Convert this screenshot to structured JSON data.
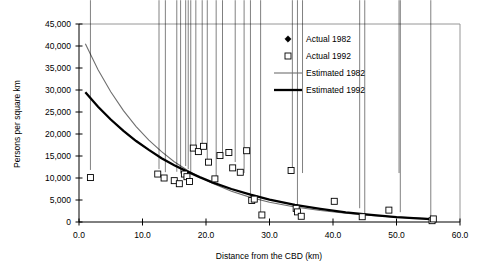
{
  "chart_data": {
    "type": "scatter",
    "title": "",
    "xlabel": "Distance from the CBD (km)",
    "ylabel": "Persons per square km",
    "xlim": [
      0.0,
      60.0
    ],
    "ylim": [
      0,
      45000
    ],
    "xticks": [
      "0.0",
      "10.0",
      "20.0",
      "30.0",
      "40.0",
      "50.0",
      "60.0"
    ],
    "xtick_values": [
      0,
      10,
      20,
      30,
      40,
      50,
      60
    ],
    "yticks": [
      "0",
      "5,000",
      "10,000",
      "15,000",
      "20,000",
      "25,000",
      "30,000",
      "35,000",
      "40,000",
      "45,000"
    ],
    "ytick_values": [
      0,
      5000,
      10000,
      15000,
      20000,
      25000,
      30000,
      35000,
      40000,
      45000
    ],
    "grid": false,
    "legend_position": "top-right",
    "legend": [
      {
        "label": "Actual 1982",
        "marker": "filled-diamond",
        "color": "#000000"
      },
      {
        "label": "Actual 1992",
        "marker": "open-square",
        "color": "#000000"
      },
      {
        "label": "Estimated 1982",
        "marker": "thin-line",
        "color": "#6f6f6f"
      },
      {
        "label": "Estimated 1992",
        "marker": "thick-line",
        "color": "#000000"
      }
    ],
    "series": [
      {
        "name": "Actual 1982",
        "type": "scatter",
        "marker": "filled-diamond",
        "points": [
          [
            1.8,
            11100
          ],
          [
            12.6,
            11300
          ],
          [
            13.6,
            10600
          ],
          [
            15.4,
            10700
          ],
          [
            16.0,
            10300
          ],
          [
            16.8,
            12000
          ],
          [
            17.2,
            11300
          ],
          [
            17.6,
            10200
          ],
          [
            18.4,
            15900
          ],
          [
            19.4,
            16500
          ],
          [
            20.2,
            12600
          ],
          [
            21.6,
            9000
          ],
          [
            22.6,
            14200
          ],
          [
            24.6,
            12900
          ],
          [
            26.0,
            10400
          ],
          [
            27.0,
            4200
          ],
          [
            28.6,
            1200
          ],
          [
            33.6,
            10500
          ],
          [
            34.4,
            2100
          ],
          [
            35.2,
            10400
          ],
          [
            44.2,
            2400
          ],
          [
            45.0,
            700
          ],
          [
            50.4,
            10400
          ],
          [
            50.6,
            1500
          ],
          [
            55.4,
            500
          ]
        ]
      },
      {
        "name": "Actual 1992",
        "type": "scatter",
        "marker": "open-square",
        "points": [
          [
            1.8,
            10100
          ],
          [
            12.4,
            10900
          ],
          [
            13.4,
            10000
          ],
          [
            15.0,
            9400
          ],
          [
            15.8,
            8700
          ],
          [
            16.6,
            10900
          ],
          [
            17.0,
            10300
          ],
          [
            17.4,
            9200
          ],
          [
            18.0,
            16800
          ],
          [
            18.8,
            16000
          ],
          [
            19.6,
            17200
          ],
          [
            20.4,
            13600
          ],
          [
            21.4,
            9800
          ],
          [
            22.2,
            15100
          ],
          [
            23.6,
            15800
          ],
          [
            24.2,
            12300
          ],
          [
            25.4,
            11300
          ],
          [
            26.4,
            16200
          ],
          [
            27.2,
            4900
          ],
          [
            27.6,
            5200
          ],
          [
            28.8,
            1600
          ],
          [
            33.4,
            11700
          ],
          [
            34.2,
            3100
          ],
          [
            34.4,
            2300
          ],
          [
            35.0,
            1300
          ],
          [
            40.2,
            4700
          ],
          [
            44.6,
            1200
          ],
          [
            48.8,
            2700
          ],
          [
            55.6,
            300
          ],
          [
            55.8,
            700
          ]
        ]
      },
      {
        "name": "Estimated 1982",
        "type": "line",
        "style": "thin",
        "points": [
          [
            1.0,
            40500
          ],
          [
            3.0,
            34600
          ],
          [
            5.0,
            29600
          ],
          [
            7.0,
            25300
          ],
          [
            9.0,
            21700
          ],
          [
            11.0,
            18600
          ],
          [
            13.0,
            16000
          ],
          [
            15.0,
            13700
          ],
          [
            17.0,
            11800
          ],
          [
            19.0,
            10200
          ],
          [
            21.0,
            8800
          ],
          [
            24.0,
            7000
          ],
          [
            27.0,
            5600
          ],
          [
            30.0,
            4500
          ],
          [
            34.0,
            3400
          ],
          [
            38.0,
            2600
          ],
          [
            42.0,
            2000
          ],
          [
            46.0,
            1500
          ],
          [
            50.0,
            1100
          ],
          [
            56.0,
            700
          ]
        ]
      },
      {
        "name": "Estimated 1992",
        "type": "line",
        "style": "thick",
        "points": [
          [
            1.0,
            29500
          ],
          [
            3.0,
            26200
          ],
          [
            5.0,
            23300
          ],
          [
            7.0,
            20700
          ],
          [
            9.0,
            18400
          ],
          [
            11.0,
            16400
          ],
          [
            13.0,
            14500
          ],
          [
            15.0,
            12900
          ],
          [
            17.0,
            11500
          ],
          [
            19.0,
            10200
          ],
          [
            21.0,
            9000
          ],
          [
            24.0,
            7500
          ],
          [
            27.0,
            6200
          ],
          [
            30.0,
            5100
          ],
          [
            34.0,
            3900
          ],
          [
            38.0,
            3000
          ],
          [
            42.0,
            2200
          ],
          [
            46.0,
            1600
          ],
          [
            50.0,
            1100
          ],
          [
            56.0,
            600
          ]
        ]
      }
    ]
  }
}
